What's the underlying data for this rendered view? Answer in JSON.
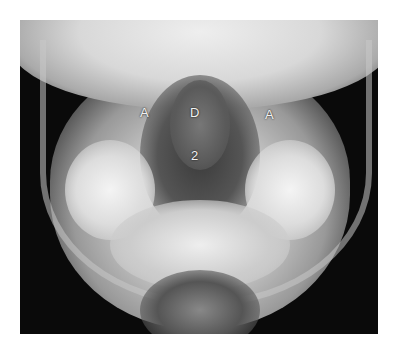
{
  "image": {
    "description": "Open-mouth odontoid radiograph (AP view of C1-C2)",
    "labels": [
      {
        "text": "A",
        "meaning": "lateral mass of atlas (left)"
      },
      {
        "text": "D",
        "meaning": "dens"
      },
      {
        "text": "A",
        "meaning": "lateral mass of atlas (right)"
      },
      {
        "text": "2",
        "meaning": "C2 vertebral body"
      }
    ]
  }
}
